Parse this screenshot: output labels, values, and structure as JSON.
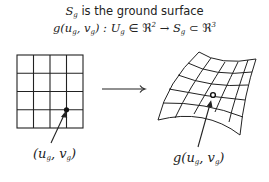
{
  "header": {
    "line1_symbol": "S",
    "line1_symbol_sub": "g",
    "line1_text": " is the ground surface",
    "line2": {
      "func": "g(u",
      "sub1": "g",
      "comma": ", v",
      "sub2": "g",
      "close": ") : U",
      "sub3": "g",
      "in": " ∈ ℜ",
      "sup1": "2",
      "arrow": " → S",
      "sub4": "g",
      "subset": " ⊂ ℜ",
      "sup2": "3"
    }
  },
  "left_panel": {
    "grid_rows": 4,
    "grid_cols": 4,
    "label": {
      "open": "(u",
      "sub1": "g",
      "mid": ", v",
      "sub2": "g",
      "close": ")"
    }
  },
  "mapping_arrow": "→",
  "right_panel": {
    "label": {
      "open": "g(u",
      "sub1": "g",
      "mid": ", v",
      "sub2": "g",
      "close": ")"
    }
  },
  "colors": {
    "stroke": "#222222",
    "background": "#ffffff"
  }
}
